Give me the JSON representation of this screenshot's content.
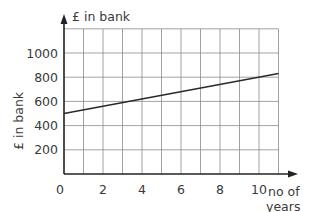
{
  "chart_data": {
    "type": "line",
    "title": "",
    "xlabel": "no of years",
    "ylabel": "£ in bank",
    "y_axis_top_label": "£ in bank",
    "x_ticks": [
      0,
      2,
      4,
      6,
      8,
      10
    ],
    "x_tick_labels": [
      "0",
      "2",
      "4",
      "6",
      "8",
      "10"
    ],
    "y_ticks": [
      200,
      400,
      600,
      800,
      1000
    ],
    "y_tick_labels": [
      "200",
      "400",
      "600",
      "800",
      "1000"
    ],
    "xlim": [
      0,
      11
    ],
    "ylim": [
      0,
      1200
    ],
    "grid": true,
    "legend": null,
    "series": [
      {
        "name": "£ in bank",
        "x": [
          0,
          11
        ],
        "values": [
          500,
          830
        ]
      }
    ]
  },
  "labels": {
    "y_axis_title": "£ in bank",
    "y_axis_top": "£ in bank",
    "x_axis_line1": "no of",
    "x_axis_line2": "years",
    "origin": "0"
  }
}
